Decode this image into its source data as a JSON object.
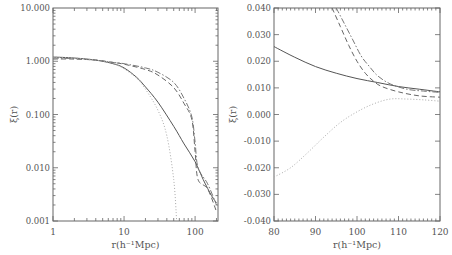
{
  "chart_data": [
    {
      "type": "line",
      "panel": "left",
      "xlabel": "r(h⁻¹Mpc)",
      "ylabel": "ξ(r)",
      "xscale": "log",
      "yscale": "log",
      "xlim": [
        1,
        210
      ],
      "ylim": [
        0.001,
        10.0
      ],
      "xticks": [
        "1",
        "10",
        "100"
      ],
      "yticks": [
        "10.000",
        "1.000",
        "0.100",
        "0.010",
        "0.001"
      ],
      "series": [
        {
          "name": "solid",
          "style": "solid",
          "x": [
            1,
            2,
            4,
            7,
            10,
            15,
            20,
            30,
            50,
            70,
            100,
            130,
            170,
            200
          ],
          "y": [
            1.2,
            1.15,
            1.05,
            0.9,
            0.75,
            0.5,
            0.33,
            0.17,
            0.06,
            0.028,
            0.013,
            0.006,
            0.003,
            0.0022
          ]
        },
        {
          "name": "dashed",
          "style": "dashed",
          "x": [
            1,
            2,
            4,
            7,
            10,
            20,
            30,
            50,
            70,
            90,
            100,
            110,
            150,
            200
          ],
          "y": [
            1.1,
            1.1,
            1.05,
            0.95,
            0.88,
            0.7,
            0.55,
            0.32,
            0.16,
            0.08,
            0.02,
            0.006,
            0.004,
            0.0015
          ]
        },
        {
          "name": "dash-dot",
          "style": "dashdot",
          "x": [
            1,
            2,
            4,
            7,
            10,
            20,
            30,
            50,
            70,
            90,
            100,
            110,
            150,
            200
          ],
          "y": [
            1.15,
            1.12,
            1.05,
            0.95,
            0.9,
            0.75,
            0.62,
            0.4,
            0.2,
            0.09,
            0.03,
            0.01,
            0.005,
            0.002
          ]
        },
        {
          "name": "dotted",
          "style": "dotted",
          "x": [
            1,
            2,
            4,
            7,
            10,
            15,
            20,
            30,
            40,
            50,
            55
          ],
          "y": [
            1.2,
            1.15,
            1.05,
            0.9,
            0.72,
            0.48,
            0.3,
            0.12,
            0.04,
            0.006,
            0.001
          ]
        }
      ]
    },
    {
      "type": "line",
      "panel": "right",
      "xlabel": "r(h⁻¹Mpc)",
      "ylabel": "ξ(r)",
      "xlim": [
        80,
        120
      ],
      "ylim": [
        -0.04,
        0.04
      ],
      "xticks": [
        "80",
        "90",
        "100",
        "110",
        "120"
      ],
      "yticks": [
        "0.040",
        "0.030",
        "0.020",
        "0.010",
        "0.000",
        "-0.010",
        "-0.020",
        "-0.030",
        "-0.040"
      ],
      "series": [
        {
          "name": "solid",
          "style": "solid",
          "x": [
            80,
            85,
            90,
            95,
            100,
            105,
            110,
            115,
            120
          ],
          "y": [
            0.0255,
            0.0215,
            0.018,
            0.0155,
            0.0135,
            0.012,
            0.0105,
            0.0095,
            0.0085
          ]
        },
        {
          "name": "dashed",
          "style": "dashed",
          "x": [
            94,
            96,
            98,
            100,
            102,
            104,
            106,
            110,
            115,
            120
          ],
          "y": [
            0.04,
            0.033,
            0.026,
            0.02,
            0.0155,
            0.0125,
            0.0105,
            0.0085,
            0.007,
            0.0065
          ]
        },
        {
          "name": "dash-dot",
          "style": "dashdot",
          "x": [
            95,
            97,
            99,
            101,
            103,
            105,
            108,
            112,
            116,
            120
          ],
          "y": [
            0.04,
            0.034,
            0.028,
            0.022,
            0.018,
            0.0145,
            0.0115,
            0.0095,
            0.0088,
            0.0083
          ]
        },
        {
          "name": "dotted",
          "style": "dotted",
          "x": [
            80,
            84,
            88,
            92,
            96,
            100,
            104,
            108,
            112,
            116,
            120
          ],
          "y": [
            -0.0235,
            -0.02,
            -0.0145,
            -0.0085,
            -0.003,
            0.001,
            0.004,
            0.0058,
            0.0058,
            0.0055,
            0.005
          ]
        }
      ]
    }
  ]
}
